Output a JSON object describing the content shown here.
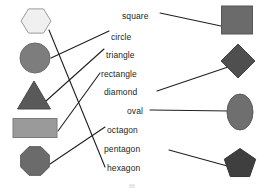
{
  "page": {
    "page_number": "88",
    "background_color": "#ffffff",
    "line_color": "#231f20",
    "text_color": "#231f20"
  },
  "labels": [
    {
      "id": "square",
      "text": "square",
      "x": 122,
      "y": 12,
      "align": "left"
    },
    {
      "id": "circle",
      "text": "circle",
      "x": 111,
      "y": 33,
      "align": "left"
    },
    {
      "id": "triangle",
      "text": "triangle",
      "x": 106,
      "y": 51,
      "align": "left"
    },
    {
      "id": "rectangle",
      "text": "rectangle",
      "x": 101,
      "y": 70,
      "align": "left"
    },
    {
      "id": "diamond",
      "text": "diamond",
      "x": 104,
      "y": 88,
      "align": "left"
    },
    {
      "id": "oval",
      "text": "oval",
      "x": 127,
      "y": 107,
      "align": "left"
    },
    {
      "id": "octagon",
      "text": "octagon",
      "x": 107,
      "y": 126,
      "align": "left"
    },
    {
      "id": "pentagon",
      "text": "pentagon",
      "x": 104,
      "y": 145,
      "align": "left"
    },
    {
      "id": "hexagon",
      "text": "hexagon",
      "x": 107,
      "y": 164,
      "align": "left"
    }
  ],
  "left_shapes": [
    {
      "id": "hexagon",
      "name": "hexagon",
      "fill": "#f0f0f0",
      "stroke": "#9a9a9a",
      "cx": 36,
      "cy": 21,
      "w": 30,
      "h": 28
    },
    {
      "id": "circle",
      "name": "circle",
      "fill": "#7d7d7d",
      "stroke": "#6a6a6a",
      "cx": 35,
      "cy": 58,
      "w": 31,
      "h": 30
    },
    {
      "id": "triangle",
      "name": "triangle",
      "fill": "#595959",
      "stroke": "#4a4a4a",
      "cx": 34,
      "cy": 95,
      "w": 33,
      "h": 28
    },
    {
      "id": "rectangle",
      "name": "rectangle",
      "fill": "#9a9a9a",
      "stroke": "#7d7d7d",
      "cx": 35,
      "cy": 128,
      "w": 44,
      "h": 19
    },
    {
      "id": "octagon",
      "name": "octagon",
      "fill": "#6b6b6b",
      "stroke": "#5a5a5a",
      "cx": 35,
      "cy": 161,
      "w": 31,
      "h": 31
    }
  ],
  "right_shapes": [
    {
      "id": "square",
      "name": "square",
      "fill": "#6b6b6b",
      "stroke": "#565656",
      "cx": 237,
      "cy": 20,
      "w": 31,
      "h": 28
    },
    {
      "id": "diamond",
      "name": "diamond",
      "fill": "#4f4f4f",
      "stroke": "#454545",
      "cx": 238,
      "cy": 61,
      "w": 34,
      "h": 34
    },
    {
      "id": "oval",
      "name": "oval",
      "fill": "#6f6f6f",
      "stroke": "#5c5c5c",
      "cx": 240,
      "cy": 112,
      "w": 26,
      "h": 36
    },
    {
      "id": "pentagon",
      "name": "pentagon",
      "fill": "#3f3f3f",
      "stroke": "#353535",
      "cx": 240,
      "cy": 164,
      "w": 33,
      "h": 31
    }
  ],
  "connectors": [
    {
      "id": "hexagon-to-hexagon",
      "from": "left-hexagon",
      "to": "label-hexagon",
      "x1": 49,
      "y1": 30,
      "x2": 105,
      "y2": 167
    },
    {
      "id": "circle-to-circle",
      "from": "left-circle",
      "to": "label-circle",
      "x1": 51,
      "y1": 58,
      "x2": 109,
      "y2": 31
    },
    {
      "id": "triangle-to-triangle",
      "from": "left-triangle",
      "to": "label-triangle",
      "x1": 46,
      "y1": 101,
      "x2": 104,
      "y2": 49
    },
    {
      "id": "rectangle-to-rectangle",
      "from": "left-rectangle",
      "to": "label-rectangle",
      "x1": 58,
      "y1": 131,
      "x2": 100,
      "y2": 73
    },
    {
      "id": "octagon-to-octagon",
      "from": "left-octagon",
      "to": "label-octagon",
      "x1": 50,
      "y1": 164,
      "x2": 105,
      "y2": 127
    },
    {
      "id": "square-to-square",
      "from": "label-square",
      "to": "right-square",
      "x1": 160,
      "y1": 13,
      "x2": 221,
      "y2": 26
    },
    {
      "id": "diamond-to-diamond",
      "from": "label-diamond",
      "to": "right-diamond",
      "x1": 157,
      "y1": 91,
      "x2": 231,
      "y2": 66
    },
    {
      "id": "oval-to-oval",
      "from": "label-oval",
      "to": "right-oval",
      "x1": 150,
      "y1": 110,
      "x2": 231,
      "y2": 111
    },
    {
      "id": "pentagon-to-pentagon",
      "from": "label-pentagon",
      "to": "right-pentagon",
      "x1": 169,
      "y1": 150,
      "x2": 231,
      "y2": 167
    }
  ]
}
